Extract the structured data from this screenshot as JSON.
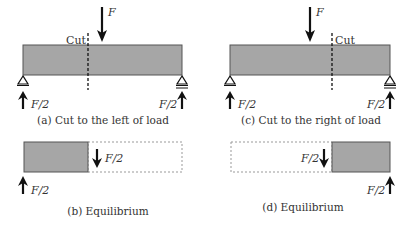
{
  "colors": {
    "beam_fill": "#a6a6a6",
    "beam_stroke": "#555555",
    "line": "#111111",
    "dashed": "#999999"
  },
  "panels": {
    "a": {
      "caption": "(a) Cut to the left of load",
      "cut_label": "Cut",
      "load_label": "F",
      "reaction_left": "F/2",
      "reaction_right": "F/2"
    },
    "c": {
      "caption": "(c) Cut to the right of load",
      "cut_label": "Cut",
      "load_label": "F",
      "reaction_left": "F/2",
      "reaction_right": "F/2"
    },
    "b": {
      "caption": "(b) Equilibrium",
      "shear_label": "F/2",
      "reaction_label": "F/2"
    },
    "d": {
      "caption": "(d) Equilibrium",
      "shear_label": "F/2",
      "reaction_label": "F/2"
    }
  }
}
